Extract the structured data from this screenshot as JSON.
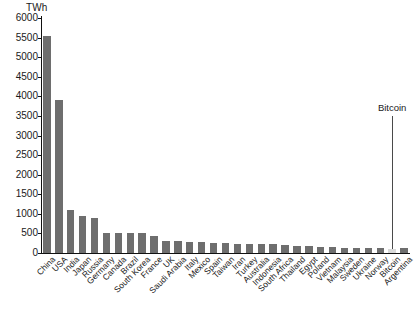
{
  "chart_data": {
    "type": "bar",
    "title": "",
    "subtitle": "",
    "xlabel": "",
    "ylabel": "TWh",
    "unit_label": "TWh",
    "ylim": [
      0,
      6000
    ],
    "ytick_step": 500,
    "yticks": [
      6000,
      5500,
      5000,
      4500,
      4000,
      3500,
      3000,
      2500,
      2000,
      1500,
      1000,
      500,
      0
    ],
    "ytick_labels": [
      "6000",
      "5500",
      "5000",
      "4500",
      "4000",
      "3500",
      "3000",
      "2500",
      "2000",
      "1500",
      "1000",
      "500",
      "0"
    ],
    "grid": false,
    "legend": null,
    "legend_position": "none",
    "bar_color": "#6e6e6e",
    "highlight_color": "#d9d9d9",
    "highlight_category": "Bitcoin",
    "categories": [
      "China",
      "USA",
      "India",
      "Japan",
      "Russia",
      "Germany",
      "Canada",
      "Brazil",
      "South Korea",
      "France",
      "UK",
      "Saudi Arabia",
      "Italy",
      "Mexico",
      "Spain",
      "Taiwan",
      "Iran",
      "Turkey",
      "Australia",
      "Indonesia",
      "South Africa",
      "Thailand",
      "Egypt",
      "Poland",
      "Vietnam",
      "Malaysia",
      "Sweden",
      "Ukraine",
      "Norway",
      "Bitcoin",
      "Argentina"
    ],
    "values": [
      5550,
      3900,
      1100,
      940,
      900,
      520,
      500,
      500,
      500,
      440,
      310,
      300,
      290,
      280,
      250,
      250,
      240,
      230,
      220,
      220,
      210,
      190,
      170,
      150,
      150,
      140,
      130,
      120,
      120,
      110,
      120
    ],
    "annotations": [
      {
        "text": "Bitcoin",
        "target_category": "Bitcoin",
        "leader_line": true,
        "label_value": 3500
      }
    ]
  },
  "figure": {
    "background_color": "#ffffff",
    "axis_color": "#111111",
    "text_color": "#1a1a1a"
  }
}
